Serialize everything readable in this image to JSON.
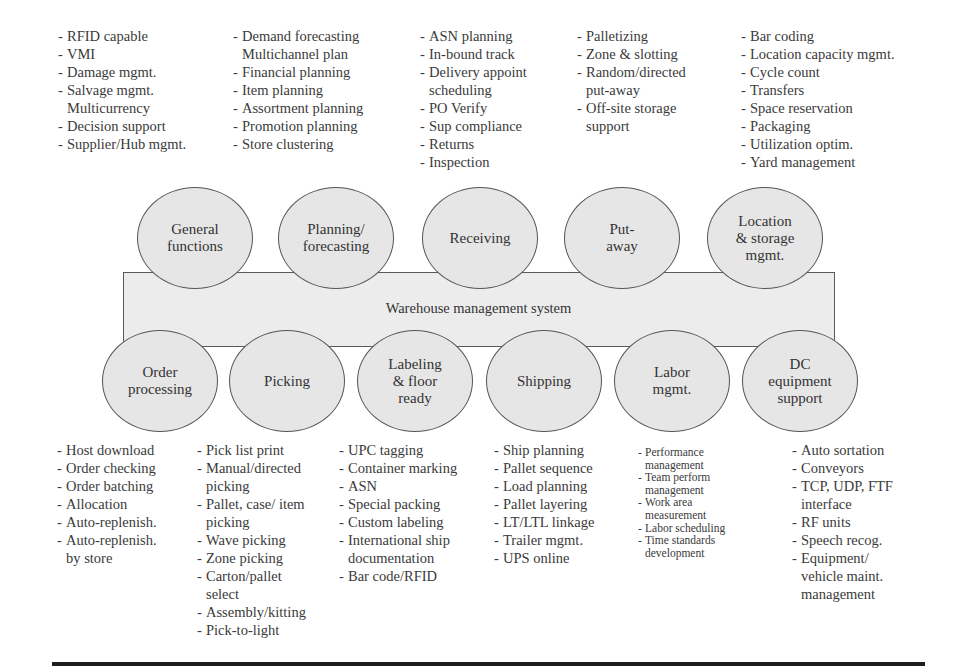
{
  "center": {
    "label": "Warehouse management system"
  },
  "top_nodes": [
    {
      "label": "General\nfunctions",
      "items": [
        "RFID capable",
        "VMI",
        "Damage mgmt.",
        "Salvage mgmt.\nMulticurrency",
        "Decision support",
        "Supplier/Hub mgmt."
      ]
    },
    {
      "label": "Planning/\nforecasting",
      "items": [
        "Demand forecasting\nMultichannel plan",
        "Financial planning",
        "Item planning",
        "Assortment planning",
        "Promotion planning",
        "Store clustering"
      ]
    },
    {
      "label": "Receiving",
      "items": [
        "ASN planning",
        "In-bound track",
        "Delivery appoint\nscheduling",
        "PO Verify",
        "Sup compliance",
        "Returns",
        "Inspection"
      ]
    },
    {
      "label": "Put-\naway",
      "items": [
        "Palletizing",
        "Zone & slotting",
        "Random/directed\nput-away",
        "Off-site storage\nsupport"
      ]
    },
    {
      "label": "Location\n& storage\nmgmt.",
      "items": [
        "Bar coding",
        "Location capacity mgmt.",
        "Cycle count",
        "Transfers",
        "Space reservation",
        "Packaging",
        "Utilization optim.",
        "Yard management"
      ]
    }
  ],
  "bottom_nodes": [
    {
      "label": "Order\nprocessing",
      "items": [
        "Host download",
        "Order checking",
        "Order batching",
        "Allocation",
        "Auto-replenish.",
        "Auto-replenish.\nby store"
      ]
    },
    {
      "label": "Picking",
      "items": [
        "Pick list print",
        "Manual/directed\npicking",
        "Pallet, case/ item\npicking",
        "Wave picking",
        "Zone picking",
        "Carton/pallet\nselect",
        "Assembly/kitting",
        "Pick-to-light"
      ]
    },
    {
      "label": "Labeling\n& floor\nready",
      "items": [
        "UPC tagging",
        "Container marking",
        "ASN",
        "Special packing",
        "Custom labeling",
        "International ship\ndocumentation",
        "Bar code/RFID"
      ]
    },
    {
      "label": "Shipping",
      "items": [
        "Ship planning",
        "Pallet sequence",
        "Load planning",
        "Pallet layering",
        "LT/LTL linkage",
        "Trailer mgmt.",
        "UPS online"
      ]
    },
    {
      "label": "Labor\nmgmt.",
      "items": [
        "Performance\nmanagement",
        "Team perform\nmanagement",
        "Work area\nmeasurement",
        "Labor scheduling",
        "Time standards\ndevelopment"
      ]
    },
    {
      "label": "DC\nequipment\nsupport",
      "items": [
        "Auto sortation",
        "Conveyors",
        "TCP, UDP, FTF\ninterface",
        "RF units",
        "Speech recog.",
        "Equipment/\nvehicle maint.\nmanagement"
      ]
    }
  ]
}
